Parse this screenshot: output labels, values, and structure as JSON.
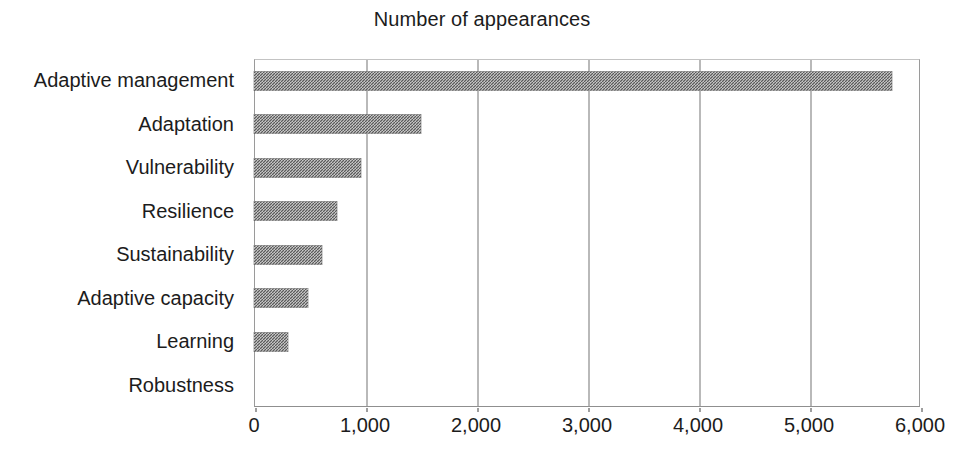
{
  "chart_data": {
    "type": "bar",
    "orientation": "horizontal",
    "title": "Number of appearances",
    "xlabel": "",
    "ylabel": "",
    "categories": [
      "Adaptive management",
      "Adaptation",
      "Vulnerability",
      "Resilience",
      "Sustainability",
      "Adaptive capacity",
      "Learning",
      "Robustness"
    ],
    "values": [
      5750,
      1500,
      960,
      750,
      610,
      490,
      310,
      0
    ],
    "xlim": [
      0,
      6000
    ],
    "xticks": [
      0,
      1000,
      2000,
      3000,
      4000,
      5000,
      6000
    ],
    "xticklabels": [
      "0",
      "1,000",
      "2,000",
      "3,000",
      "4,000",
      "5,000",
      "6,000"
    ],
    "grid": "vertical",
    "legend": "none",
    "bar_color": "#5a5a5a",
    "bar_pattern": "checkerboard-dither",
    "background_color": "#ffffff",
    "axis_color": "#9a9a9a"
  }
}
